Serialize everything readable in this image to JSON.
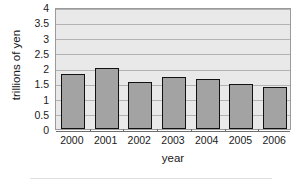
{
  "chart_data": {
    "type": "bar",
    "title": "",
    "xlabel": "year",
    "ylabel": "trillions of yen",
    "categories": [
      "2000",
      "2001",
      "2002",
      "2003",
      "2004",
      "2005",
      "2006"
    ],
    "values": [
      1.8,
      2.0,
      1.53,
      1.7,
      1.65,
      1.47,
      1.37
    ],
    "series": [
      {
        "name": "trillions of yen",
        "values": [
          1.8,
          2.0,
          1.53,
          1.7,
          1.65,
          1.47,
          1.37
        ]
      }
    ],
    "ylim": [
      0,
      4
    ],
    "ytick_values": [
      0,
      0.5,
      1,
      1.5,
      2,
      2.5,
      3,
      3.5,
      4
    ],
    "ytick_labels": [
      "0",
      "0.5",
      "1",
      "1.5",
      "2",
      "2.5",
      "3",
      "3.5",
      "4"
    ],
    "grid": true,
    "grid_axis": "y",
    "legend": false,
    "legend_position": "none",
    "bar_color": "#a3a3a3",
    "bar_edge_color": "#121212",
    "plot_background": "#e9e9e9",
    "gridline_color": "#b3b3b3",
    "axis_color": "#6e6e6e",
    "text_color": "#1a1a1a"
  }
}
